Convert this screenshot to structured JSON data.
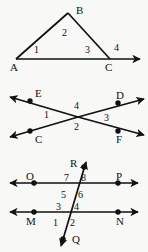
{
  "document": {
    "title": "Geometry angle-numbering figures",
    "background_color": "#f8f8f7",
    "ink_color": "#111111",
    "width": 148,
    "height": 252
  },
  "figures": [
    {
      "id": "figure-triangle",
      "name": "triangle-with-exterior-angle",
      "description": "Triangle ABC on a ray extending past C, with angles 1, 2, 3 inside and exterior angle 4",
      "point_labels": [
        {
          "text": "A",
          "x": 10,
          "y": 62
        },
        {
          "text": "B",
          "x": 76,
          "y": 5
        },
        {
          "text": "C",
          "x": 105,
          "y": 62
        }
      ],
      "angle_labels": [
        {
          "text": "1",
          "x": 34,
          "y": 45
        },
        {
          "text": "2",
          "x": 62,
          "y": 28
        },
        {
          "text": "3",
          "x": 85,
          "y": 45
        },
        {
          "text": "4",
          "x": 114,
          "y": 43
        }
      ]
    },
    {
      "id": "figure-x-crossing",
      "name": "two-crossing-lines-ec-df",
      "description": "Two lines crossing in an X, with endpoints E, C on the left and D, F on the right; angles 1, 2, 3, 4 around the intersection",
      "point_labels": [
        {
          "text": "E",
          "x": 35,
          "y": 88
        },
        {
          "text": "C",
          "x": 35,
          "y": 134
        },
        {
          "text": "D",
          "x": 116,
          "y": 90
        },
        {
          "text": "F",
          "x": 116,
          "y": 134
        }
      ],
      "angle_labels": [
        {
          "text": "1",
          "x": 44,
          "y": 110
        },
        {
          "text": "2",
          "x": 74,
          "y": 122
        },
        {
          "text": "3",
          "x": 104,
          "y": 113
        },
        {
          "text": "4",
          "x": 74,
          "y": 101
        }
      ]
    },
    {
      "id": "figure-parallel-transversal",
      "name": "parallel-lines-with-transversal",
      "description": "Parallel lines OP and MN cut by transversal RQ, forming numbered angles 1 through 8",
      "point_labels": [
        {
          "text": "O",
          "x": 26,
          "y": 171
        },
        {
          "text": "P",
          "x": 116,
          "y": 171
        },
        {
          "text": "M",
          "x": 26,
          "y": 216
        },
        {
          "text": "N",
          "x": 116,
          "y": 216
        },
        {
          "text": "R",
          "x": 70,
          "y": 158
        },
        {
          "text": "Q",
          "x": 72,
          "y": 234
        }
      ],
      "angle_labels": [
        {
          "text": "7",
          "x": 64,
          "y": 173
        },
        {
          "text": "8",
          "x": 81,
          "y": 173
        },
        {
          "text": "5",
          "x": 61,
          "y": 190
        },
        {
          "text": "6",
          "x": 78,
          "y": 190
        },
        {
          "text": "3",
          "x": 56,
          "y": 202
        },
        {
          "text": "4",
          "x": 74,
          "y": 202
        },
        {
          "text": "1",
          "x": 53,
          "y": 218
        },
        {
          "text": "2",
          "x": 70,
          "y": 218
        }
      ]
    }
  ]
}
